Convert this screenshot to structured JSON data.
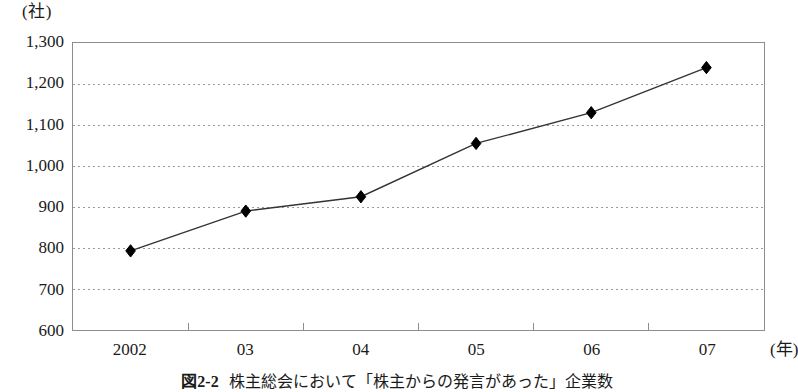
{
  "chart_data": {
    "type": "line",
    "caption_number": "図2-2",
    "caption_text": "株主総会において「株主からの発言があった」企業数",
    "xlabel": "",
    "ylabel": "",
    "x_unit": "(年)",
    "y_unit": "(社)",
    "categories": [
      "2002",
      "03",
      "04",
      "05",
      "06",
      "07"
    ],
    "values": [
      793,
      890,
      925,
      1055,
      1130,
      1240
    ],
    "series": [
      {
        "name": "株主からの発言があった企業数",
        "values": [
          793,
          890,
          925,
          1055,
          1130,
          1240
        ]
      }
    ],
    "ylim": [
      600,
      1300
    ],
    "yticks": [
      600,
      700,
      800,
      900,
      1000,
      1100,
      1200,
      1300
    ],
    "ytick_labels": [
      "600",
      "700",
      "800",
      "900",
      "1,000",
      "1,100",
      "1,200",
      "1,300"
    ],
    "grid": true,
    "grid_style": "dotted",
    "legend": "none",
    "marker": "diamond",
    "colors": {
      "line": "#333333",
      "marker": "#000000",
      "grid": "#9a9a9a",
      "frame": "#8c8c8c",
      "text": "#1a1a1a",
      "background": "#ffffff"
    }
  }
}
